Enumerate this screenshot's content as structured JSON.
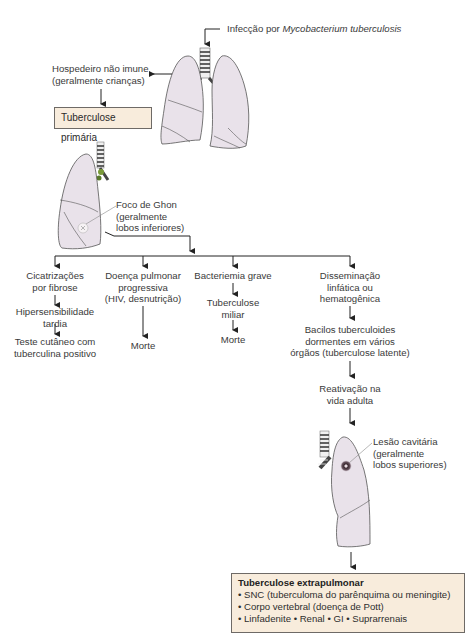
{
  "diagram": {
    "infection_label_prefix": "Infecção por ",
    "infection_label_organism": "Mycobacterium tuberculosis",
    "host": {
      "line1": "Hospedeiro não imune",
      "line2": "(geralmente crianças)"
    },
    "primary_box": "Tuberculose primária",
    "ghon": {
      "line1": "Foco de Ghon",
      "line2": "(geralmente",
      "line3": "lobos inferiores)"
    },
    "branches": [
      {
        "steps": [
          [
            "Cicatrizações",
            "por fibrose"
          ],
          [
            "Hipersensibilidade",
            "tardia"
          ],
          [
            "Teste cutâneo com",
            "tuberculina positivo"
          ]
        ]
      },
      {
        "steps": [
          [
            "Doença pulmonar",
            "progressiva",
            "(HIV, desnutrição)"
          ],
          [
            "Morte"
          ]
        ]
      },
      {
        "steps": [
          [
            "Bacteriemia grave"
          ],
          [
            "Tuberculose",
            "miliar"
          ],
          [
            "Morte"
          ]
        ]
      },
      {
        "steps": [
          [
            "Disseminação",
            "linfática ou",
            "hematogênica"
          ],
          [
            "Bacilos tuberculoides",
            "dormentes em vários",
            "órgãos (tuberculose latente)"
          ],
          [
            "Reativação na",
            "vida adulta"
          ]
        ]
      }
    ],
    "cavitary": {
      "line1": "Lesão cavitária",
      "line2": "(geralmente",
      "line3": "lobos superiores)"
    },
    "extrapulmonary": {
      "title": "Tuberculose extrapulmonar",
      "items": [
        "SNC (tuberculoma do parênquima ou meningite)",
        "Corpo vertebral (doença de Pott)",
        "Linfadenite • Renal  • GI  • Suprarrenais"
      ]
    },
    "colors": {
      "lung_fill": "#e9e2ea",
      "lung_stroke": "#555555",
      "box_fill": "#f8ecdc",
      "box_stroke": "#6e6a66",
      "arrow": "#222222"
    }
  }
}
